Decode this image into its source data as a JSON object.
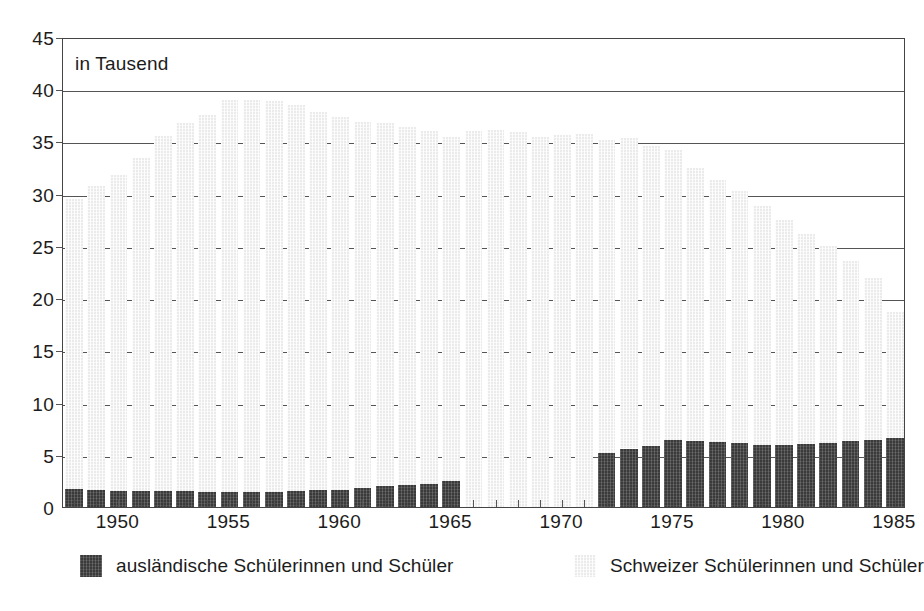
{
  "chart_data": {
    "type": "bar",
    "title": "",
    "subtitle": "",
    "note": "in Tausend",
    "xlabel": "",
    "ylabel": "",
    "stacked": true,
    "grid": true,
    "legend_position": "bottom",
    "ylim": [
      0,
      45
    ],
    "y_ticks": [
      0,
      5,
      10,
      15,
      20,
      25,
      30,
      35,
      40,
      45
    ],
    "y_tick_labels": [
      "0",
      "5",
      "10",
      "15",
      "20",
      "25",
      "30",
      "35",
      "40",
      "45"
    ],
    "x_tick_labels": [
      "1950",
      "1955",
      "1960",
      "1965",
      "1970",
      "1975",
      "1980",
      "1985"
    ],
    "categories": [
      "1948",
      "1949",
      "1950",
      "1951",
      "1952",
      "1953",
      "1954",
      "1955",
      "1956",
      "1957",
      "1958",
      "1959",
      "1960",
      "1961",
      "1962",
      "1963",
      "1964",
      "1965",
      "1966",
      "1967",
      "1968",
      "1969",
      "1970",
      "1971",
      "1972",
      "1973",
      "1974",
      "1975",
      "1976",
      "1977",
      "1978",
      "1979",
      "1980",
      "1981",
      "1982",
      "1983",
      "1984",
      "1985"
    ],
    "series": [
      {
        "name": "ausländische Schülerinnen und Schüler",
        "color": "#3a3a3a",
        "values": [
          1.7,
          1.6,
          1.5,
          1.5,
          1.5,
          1.5,
          1.4,
          1.4,
          1.4,
          1.4,
          1.5,
          1.6,
          1.6,
          1.8,
          2.0,
          2.1,
          2.2,
          2.5,
          null,
          null,
          null,
          null,
          null,
          null,
          5.2,
          5.6,
          5.8,
          6.4,
          6.3,
          6.2,
          6.1,
          5.9,
          5.9,
          6.0,
          6.1,
          6.3,
          6.4,
          6.6
        ]
      },
      {
        "name": "Schweizer Schülerinnen und Schüler",
        "color": "#ebebeb",
        "values": [
          27.8,
          29.1,
          30.3,
          31.9,
          34.0,
          35.3,
          36.1,
          37.6,
          37.6,
          37.5,
          37.0,
          36.2,
          35.7,
          35.1,
          34.8,
          34.3,
          33.8,
          32.9,
          36.0,
          36.1,
          35.9,
          35.4,
          35.6,
          35.7,
          29.9,
          29.7,
          28.8,
          27.8,
          26.2,
          25.1,
          24.2,
          22.9,
          21.6,
          20.1,
          18.9,
          17.3,
          15.5,
          12.1
        ]
      }
    ],
    "totals": [
      29.5,
      30.7,
      31.8,
      33.4,
      35.5,
      36.8,
      37.5,
      39.0,
      39.0,
      38.9,
      38.5,
      37.8,
      37.3,
      36.9,
      36.8,
      36.4,
      36.0,
      35.4,
      36.0,
      36.1,
      35.9,
      35.4,
      35.6,
      35.7,
      35.1,
      35.3,
      34.6,
      34.2,
      32.5,
      31.3,
      30.3,
      28.8,
      27.5,
      26.1,
      25.0,
      23.6,
      21.9,
      18.7
    ]
  },
  "legend": {
    "items": [
      {
        "label": "ausländische Schülerinnen und Schüler",
        "swatch": "dark"
      },
      {
        "label": "Schweizer Schülerinnen und Schüler",
        "swatch": "light"
      }
    ]
  }
}
